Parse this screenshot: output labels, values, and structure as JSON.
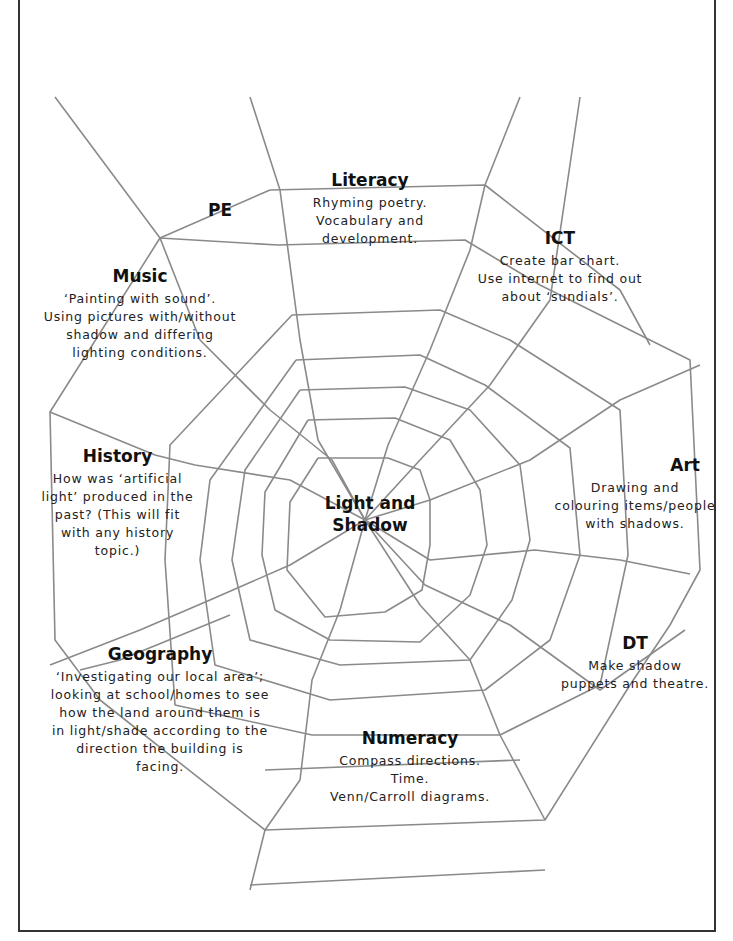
{
  "center": {
    "line1": "Light and",
    "line2": "Shadow"
  },
  "topics": [
    {
      "id": "literacy",
      "title": "Literacy",
      "lines": [
        "Rhyming poetry.",
        "Vocabulary and",
        "development."
      ]
    },
    {
      "id": "pe",
      "title": "PE",
      "lines": []
    },
    {
      "id": "ict",
      "title": "ICT",
      "lines": [
        "Create bar chart.",
        "Use internet to find out",
        "about ‘sundials’."
      ]
    },
    {
      "id": "music",
      "title": "Music",
      "lines": [
        "‘Painting with sound’.",
        "Using pictures with/without",
        "shadow and differing",
        "lighting conditions."
      ]
    },
    {
      "id": "history",
      "title": "History",
      "lines": [
        "How was ‘artificial",
        "light’ produced in the",
        "past? (This will fit",
        "with any history",
        "topic.)"
      ]
    },
    {
      "id": "art",
      "title": "Art",
      "lines": [
        "Drawing and",
        "colouring items/people",
        "with shadows."
      ]
    },
    {
      "id": "dt",
      "title": "DT",
      "lines": [
        "Make shadow",
        "puppets and theatre."
      ]
    },
    {
      "id": "geography",
      "title": "Geography",
      "lines": [
        "‘Investigating our local area’;",
        "looking at school/homes to see",
        "how the land around them is",
        "in light/shade according to the",
        "direction the building is",
        "facing."
      ]
    },
    {
      "id": "numeracy",
      "title": "Numeracy",
      "lines": [
        "Compass directions.",
        "Time.",
        "Venn/Carroll diagrams."
      ]
    }
  ],
  "colors": {
    "web_line": "#8a8a8a",
    "frame": "#333333",
    "text": "#1a1a1a"
  }
}
